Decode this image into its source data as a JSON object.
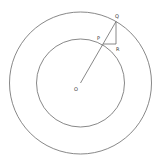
{
  "diagram": {
    "type": "concentric-circles",
    "labels": {
      "center": "O",
      "inner_point": "P",
      "outer_point": "Q",
      "corner_point": "R"
    },
    "colors": {
      "stroke": "#6a6a6a",
      "text": "#333333",
      "background": "#ffffff"
    }
  }
}
